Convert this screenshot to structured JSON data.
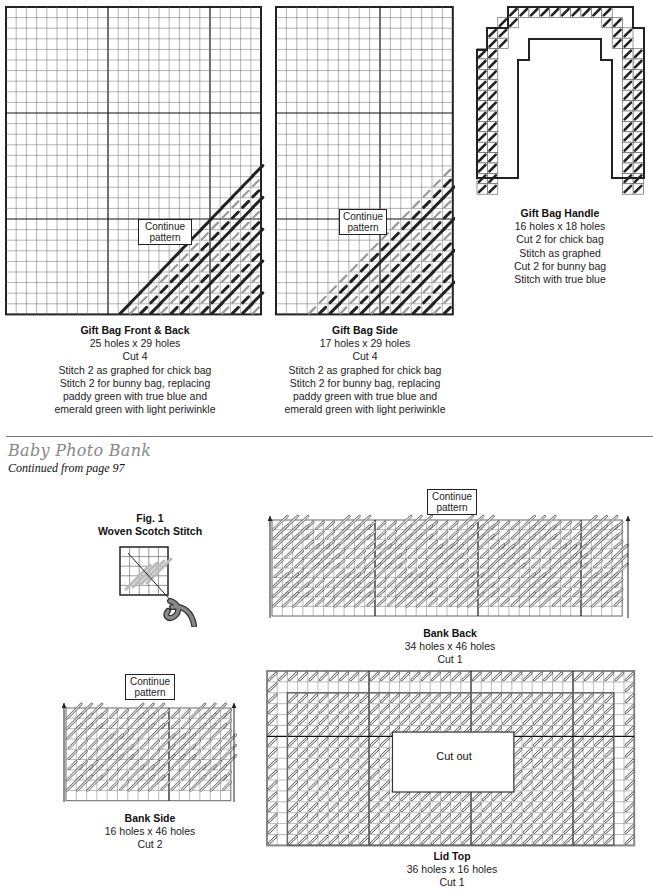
{
  "gift_bag": {
    "front_back": {
      "title": "Gift Bag Front & Back",
      "size": "25 holes x 29 holes",
      "cut": "Cut 4",
      "note1": "Stitch 2 as graphed for chick bag",
      "note2": "Stitch 2 for bunny bag, replacing",
      "note3": "paddy green with true blue and",
      "note4": "emerald green with light periwinkle",
      "continue_label_1": "Continue",
      "continue_label_2": "pattern"
    },
    "side": {
      "title": "Gift Bag Side",
      "size": "17 holes x 29 holes",
      "cut": "Cut 4",
      "note1": "Stitch 2 as graphed for chick bag",
      "note2": "Stitch 2 for bunny bag, replacing",
      "note3": "paddy green with true blue and",
      "note4": "emerald green with light periwinkle",
      "continue_label_1": "Continue",
      "continue_label_2": "pattern"
    },
    "handle": {
      "title": "Gift Bag Handle",
      "size": "16 holes x 18 holes",
      "line1": "Cut 2 for chick bag",
      "line2": "Stitch as graphed",
      "line3": "Cut 2 for bunny bag",
      "line4": "Stitch with true blue"
    }
  },
  "section": {
    "title": "Baby Photo Bank",
    "subtitle": "Continued from page 97"
  },
  "bank": {
    "fig1": {
      "label": "Fig. 1",
      "title": "Woven Scotch Stitch"
    },
    "back": {
      "title": "Bank Back",
      "size": "34 holes x 46 holes",
      "cut": "Cut 1",
      "continue_label_1": "Continue",
      "continue_label_2": "pattern"
    },
    "side": {
      "title": "Bank Side",
      "size": "16 holes x 46 holes",
      "cut": "Cut 2",
      "continue_label_1": "Continue",
      "continue_label_2": "pattern"
    },
    "lid": {
      "title": "Lid Top",
      "size": "36 holes x 16 holes",
      "cut": "Cut 1",
      "cutout_label": "Cut out"
    }
  },
  "colors": {
    "grid_line": "#555555",
    "major_line": "#111111",
    "stitch_dark": "#222222",
    "stitch_light": "#9a9a9a",
    "section_title": "#888888"
  }
}
